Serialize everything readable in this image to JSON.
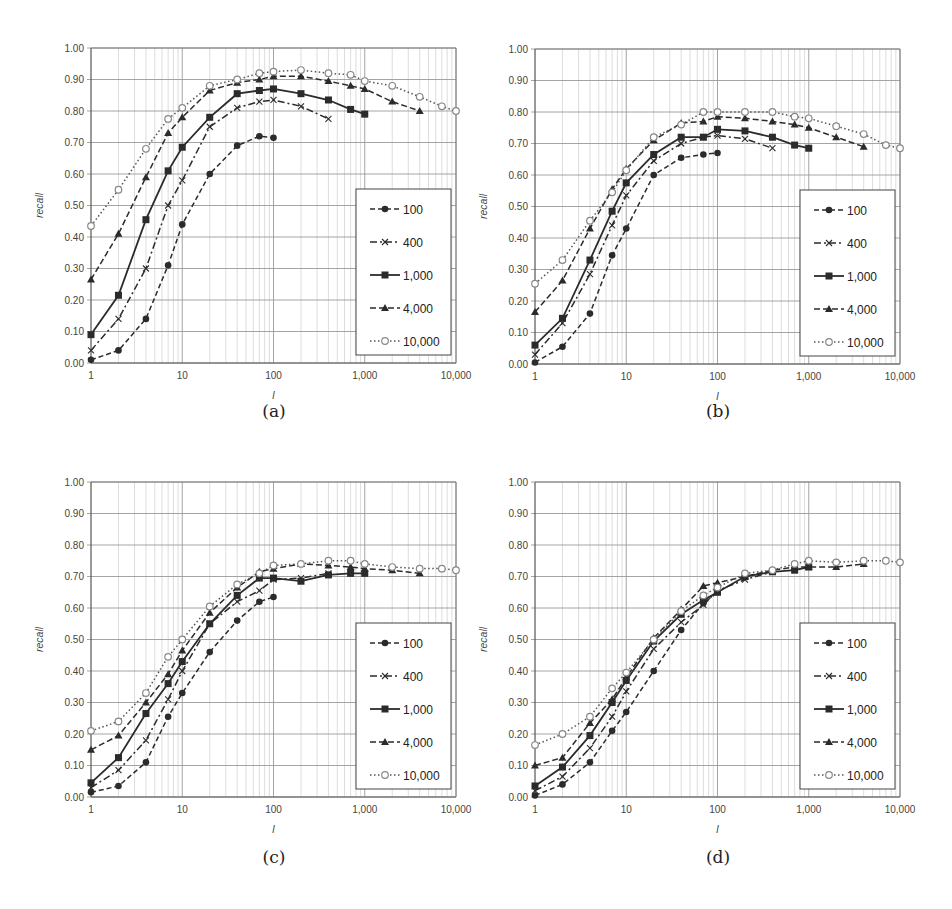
{
  "figure": {
    "captions": [
      "(a)",
      "(b)",
      "(c)",
      "(d)"
    ]
  },
  "chart_data": [
    {
      "id": "a",
      "caption": "(a)",
      "type": "line",
      "title": "",
      "xlabel": "l",
      "ylabel": "recall",
      "xscale": "log",
      "xlim": [
        1,
        10000
      ],
      "ylim": [
        0,
        1
      ],
      "x_ticks": [
        "1",
        "10",
        "100",
        "1,000",
        "10,000"
      ],
      "y_ticks": [
        "0.00",
        "0.10",
        "0.20",
        "0.30",
        "0.40",
        "0.50",
        "0.60",
        "0.70",
        "0.80",
        "0.90",
        "1.00"
      ],
      "grid": true,
      "legend_position": "lower right inside",
      "series": [
        {
          "name": "100",
          "x": [
            1,
            2,
            4,
            7,
            10,
            20,
            40,
            70,
            100
          ],
          "values": [
            0.01,
            0.04,
            0.14,
            0.31,
            0.44,
            0.6,
            0.69,
            0.72,
            0.715
          ]
        },
        {
          "name": "400",
          "x": [
            1,
            2,
            4,
            7,
            10,
            20,
            40,
            70,
            100,
            200,
            400
          ],
          "values": [
            0.04,
            0.14,
            0.3,
            0.5,
            0.58,
            0.75,
            0.81,
            0.83,
            0.835,
            0.815,
            0.775
          ]
        },
        {
          "name": "1,000",
          "x": [
            1,
            2,
            4,
            7,
            10,
            20,
            40,
            70,
            100,
            200,
            400,
            700,
            1000
          ],
          "values": [
            0.09,
            0.215,
            0.455,
            0.61,
            0.685,
            0.78,
            0.855,
            0.865,
            0.87,
            0.855,
            0.835,
            0.805,
            0.79
          ]
        },
        {
          "name": "4,000",
          "x": [
            1,
            2,
            4,
            7,
            10,
            20,
            40,
            70,
            100,
            200,
            400,
            700,
            1000,
            2000,
            4000
          ],
          "values": [
            0.265,
            0.41,
            0.59,
            0.73,
            0.78,
            0.865,
            0.89,
            0.9,
            0.91,
            0.91,
            0.895,
            0.88,
            0.87,
            0.83,
            0.8
          ]
        },
        {
          "name": "10,000",
          "x": [
            1,
            2,
            4,
            7,
            10,
            20,
            40,
            70,
            100,
            200,
            400,
            700,
            1000,
            2000,
            4000,
            7000,
            10000
          ],
          "values": [
            0.435,
            0.55,
            0.68,
            0.775,
            0.81,
            0.88,
            0.9,
            0.92,
            0.925,
            0.93,
            0.92,
            0.915,
            0.895,
            0.88,
            0.845,
            0.815,
            0.8
          ]
        }
      ]
    },
    {
      "id": "b",
      "caption": "(b)",
      "type": "line",
      "title": "",
      "xlabel": "l",
      "ylabel": "recall",
      "xscale": "log",
      "xlim": [
        1,
        10000
      ],
      "ylim": [
        0,
        1
      ],
      "x_ticks": [
        "1",
        "10",
        "100",
        "1,000",
        "10,000"
      ],
      "y_ticks": [
        "0.00",
        "0.10",
        "0.20",
        "0.30",
        "0.40",
        "0.50",
        "0.60",
        "0.70",
        "0.80",
        "0.90",
        "1.00"
      ],
      "grid": true,
      "legend_position": "lower right inside",
      "series": [
        {
          "name": "100",
          "x": [
            1,
            2,
            4,
            7,
            10,
            20,
            40,
            70,
            100
          ],
          "values": [
            0.005,
            0.055,
            0.16,
            0.345,
            0.43,
            0.6,
            0.655,
            0.665,
            0.67
          ]
        },
        {
          "name": "400",
          "x": [
            1,
            2,
            4,
            7,
            10,
            20,
            40,
            70,
            100,
            200,
            400
          ],
          "values": [
            0.03,
            0.13,
            0.285,
            0.44,
            0.535,
            0.645,
            0.7,
            0.72,
            0.725,
            0.715,
            0.685
          ]
        },
        {
          "name": "1,000",
          "x": [
            1,
            2,
            4,
            7,
            10,
            20,
            40,
            70,
            100,
            200,
            400,
            700,
            1000
          ],
          "values": [
            0.06,
            0.145,
            0.33,
            0.485,
            0.575,
            0.665,
            0.72,
            0.72,
            0.745,
            0.74,
            0.72,
            0.695,
            0.685
          ]
        },
        {
          "name": "4,000",
          "x": [
            1,
            2,
            4,
            7,
            10,
            20,
            40,
            70,
            100,
            200,
            400,
            700,
            1000,
            2000,
            4000
          ],
          "values": [
            0.165,
            0.265,
            0.43,
            0.555,
            0.62,
            0.71,
            0.765,
            0.77,
            0.785,
            0.78,
            0.77,
            0.76,
            0.75,
            0.72,
            0.69
          ]
        },
        {
          "name": "10,000",
          "x": [
            1,
            2,
            4,
            7,
            10,
            20,
            40,
            70,
            100,
            200,
            400,
            700,
            1000,
            2000,
            4000,
            7000,
            10000
          ],
          "values": [
            0.255,
            0.33,
            0.455,
            0.545,
            0.615,
            0.72,
            0.76,
            0.8,
            0.8,
            0.8,
            0.8,
            0.785,
            0.78,
            0.755,
            0.73,
            0.695,
            0.685
          ]
        }
      ]
    },
    {
      "id": "c",
      "caption": "(c)",
      "type": "line",
      "title": "",
      "xlabel": "l",
      "ylabel": "recall",
      "xscale": "log",
      "xlim": [
        1,
        10000
      ],
      "ylim": [
        0,
        1
      ],
      "x_ticks": [
        "1",
        "10",
        "100",
        "1,000",
        "10,000"
      ],
      "y_ticks": [
        "0.00",
        "0.10",
        "0.20",
        "0.30",
        "0.40",
        "0.50",
        "0.60",
        "0.70",
        "0.80",
        "0.90",
        "1.00"
      ],
      "grid": true,
      "legend_position": "lower right inside",
      "series": [
        {
          "name": "100",
          "x": [
            1,
            2,
            4,
            7,
            10,
            20,
            40,
            70,
            100
          ],
          "values": [
            0.015,
            0.035,
            0.11,
            0.255,
            0.33,
            0.46,
            0.56,
            0.62,
            0.635
          ]
        },
        {
          "name": "400",
          "x": [
            1,
            2,
            4,
            7,
            10,
            20,
            40,
            70,
            100,
            200,
            400
          ],
          "values": [
            0.03,
            0.085,
            0.18,
            0.31,
            0.4,
            0.55,
            0.62,
            0.655,
            0.69,
            0.695,
            0.71
          ]
        },
        {
          "name": "1,000",
          "x": [
            1,
            2,
            4,
            7,
            10,
            20,
            40,
            70,
            100,
            200,
            400,
            700,
            1000
          ],
          "values": [
            0.045,
            0.125,
            0.265,
            0.36,
            0.43,
            0.55,
            0.64,
            0.695,
            0.695,
            0.685,
            0.705,
            0.71,
            0.71
          ]
        },
        {
          "name": "4,000",
          "x": [
            1,
            2,
            4,
            7,
            10,
            20,
            40,
            70,
            100,
            200,
            400,
            700,
            1000,
            2000,
            4000
          ],
          "values": [
            0.15,
            0.195,
            0.3,
            0.39,
            0.465,
            0.585,
            0.665,
            0.715,
            0.725,
            0.74,
            0.735,
            0.73,
            0.725,
            0.72,
            0.71
          ]
        },
        {
          "name": "10,000",
          "x": [
            1,
            2,
            4,
            7,
            10,
            20,
            40,
            70,
            100,
            200,
            400,
            700,
            1000,
            2000,
            4000,
            7000,
            10000
          ],
          "values": [
            0.21,
            0.24,
            0.33,
            0.445,
            0.5,
            0.605,
            0.675,
            0.71,
            0.735,
            0.74,
            0.75,
            0.75,
            0.74,
            0.73,
            0.725,
            0.725,
            0.72
          ]
        }
      ]
    },
    {
      "id": "d",
      "caption": "(d)",
      "type": "line",
      "title": "",
      "xlabel": "l",
      "ylabel": "recall",
      "xscale": "log",
      "xlim": [
        1,
        10000
      ],
      "ylim": [
        0,
        1
      ],
      "x_ticks": [
        "1",
        "10",
        "100",
        "1,000",
        "10,000"
      ],
      "y_ticks": [
        "0.00",
        "0.10",
        "0.20",
        "0.30",
        "0.40",
        "0.50",
        "0.60",
        "0.70",
        "0.80",
        "0.90",
        "1.00"
      ],
      "grid": true,
      "legend_position": "lower right inside",
      "series": [
        {
          "name": "100",
          "x": [
            1,
            2,
            4,
            7,
            10,
            20,
            40,
            70,
            100
          ],
          "values": [
            0.005,
            0.04,
            0.11,
            0.21,
            0.27,
            0.4,
            0.53,
            0.615,
            0.65
          ]
        },
        {
          "name": "400",
          "x": [
            1,
            2,
            4,
            7,
            10,
            20,
            40,
            70,
            100,
            200,
            400
          ],
          "values": [
            0.02,
            0.065,
            0.155,
            0.255,
            0.335,
            0.47,
            0.555,
            0.61,
            0.655,
            0.69,
            0.715
          ]
        },
        {
          "name": "1,000",
          "x": [
            1,
            2,
            4,
            7,
            10,
            20,
            40,
            70,
            100,
            200,
            400,
            700,
            1000
          ],
          "values": [
            0.035,
            0.095,
            0.195,
            0.3,
            0.37,
            0.495,
            0.58,
            0.625,
            0.65,
            0.7,
            0.715,
            0.72,
            0.73
          ]
        },
        {
          "name": "4,000",
          "x": [
            1,
            2,
            4,
            7,
            10,
            20,
            40,
            70,
            100,
            200,
            400,
            700,
            1000,
            2000,
            4000
          ],
          "values": [
            0.1,
            0.125,
            0.235,
            0.31,
            0.38,
            0.505,
            0.595,
            0.67,
            0.68,
            0.7,
            0.72,
            0.73,
            0.73,
            0.73,
            0.74
          ]
        },
        {
          "name": "10,000",
          "x": [
            1,
            2,
            4,
            7,
            10,
            20,
            40,
            70,
            100,
            200,
            400,
            700,
            1000,
            2000,
            4000,
            7000,
            10000
          ],
          "values": [
            0.165,
            0.2,
            0.255,
            0.345,
            0.395,
            0.5,
            0.59,
            0.64,
            0.665,
            0.71,
            0.72,
            0.74,
            0.75,
            0.745,
            0.75,
            0.75,
            0.745
          ]
        }
      ]
    }
  ],
  "legend_styles": {
    "100": {
      "dash": "5,3",
      "marker": "circle-filled"
    },
    "400": {
      "dash": "7,3,2,3",
      "marker": "x"
    },
    "1,000": {
      "dash": "",
      "marker": "square-filled"
    },
    "4,000": {
      "dash": "6,3",
      "marker": "triangle-filled"
    },
    "10,000": {
      "dash": "1.5,2.5",
      "marker": "circle-open"
    }
  },
  "colors": {
    "line": "#2b2b2b",
    "grid_major": "#9a9a9a",
    "grid_minor": "#d4d4d4",
    "open_marker": "#888888"
  }
}
